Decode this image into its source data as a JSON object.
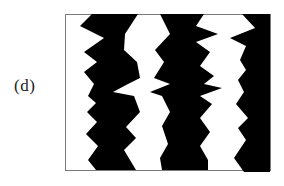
{
  "figure": {
    "panel_label": "(d)",
    "colors": {
      "stripe": "#000000",
      "background": "#ffffff",
      "frame": "#7a7a7a",
      "label": "#222222"
    },
    "frame": {
      "x": 65,
      "y": 14,
      "width": 205,
      "height": 156
    },
    "stripes": [
      {
        "name": "left-stripe",
        "points": "92,14 80,26 104,38 84,52 97,62 84,72 94,84 88,96 96,103 87,112 97,122 86,134 98,146 88,160 96,170 136,170 124,150 136,138 126,127 140,112 134,96 113,92 128,84 140,78 137,62 124,50 125,34 138,14"
      },
      {
        "name": "middle-stripe",
        "points": "160,14 170,34 155,50 164,62 154,78 170,84 150,92 162,96 170,112 162,126 168,144 160,158 162,170 208,170 208,160 200,146 210,132 200,118 212,104 200,96 222,88 204,84 214,76 200,66 210,52 196,42 218,34 196,26 204,14"
      },
      {
        "name": "right-stripe",
        "points": "242,14 255,28 230,38 246,46 240,60 246,70 238,80 244,92 236,104 248,118 238,128 246,140 234,158 244,172 270,172 270,14"
      }
    ]
  }
}
